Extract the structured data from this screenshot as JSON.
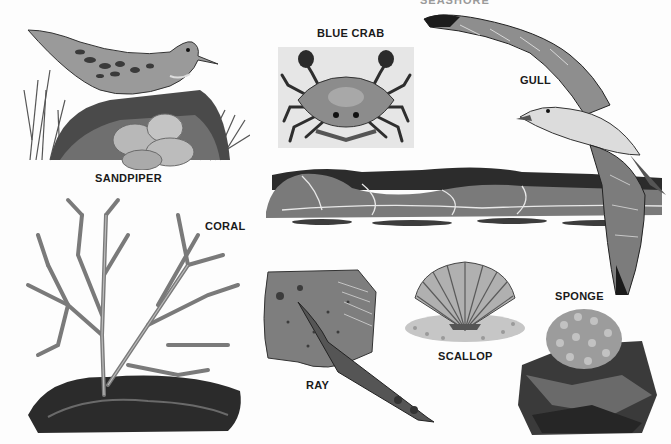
{
  "page": {
    "type": "illustration-plate",
    "header_fragment": "SEASHORE",
    "palette": {
      "background": "#fdfdfd",
      "ink_dark": "#1a1a1a",
      "ink_mid": "#6b6b6b",
      "ink_light": "#b5b5b5",
      "crab_panel": "#e6e6e6"
    }
  },
  "labels": {
    "sandpiper": "SANDPIPER",
    "blue_crab": "BLUE CRAB",
    "gull": "GULL",
    "coral": "CORAL",
    "ray": "RAY",
    "scallop": "SCALLOP",
    "sponge": "SPONGE"
  },
  "illustrations": [
    {
      "id": "sandpiper",
      "caption": "SANDPIPER",
      "subject": "sandpiper bird on nest with four speckled eggs in grass"
    },
    {
      "id": "blue_crab",
      "caption": "BLUE CRAB",
      "subject": "blue crab viewed from above on gray panel"
    },
    {
      "id": "gull",
      "caption": "GULL",
      "subject": "gull in flight with wings spread"
    },
    {
      "id": "wave",
      "caption": "",
      "subject": "breaking ocean wave"
    },
    {
      "id": "coral",
      "caption": "CORAL",
      "subject": "branching coral on dark rock"
    },
    {
      "id": "ray",
      "caption": "RAY",
      "subject": "ray with long tail"
    },
    {
      "id": "scallop",
      "caption": "SCALLOP",
      "subject": "scallop shell on gravel"
    },
    {
      "id": "sponge",
      "caption": "SPONGE",
      "subject": "sponge growing on rock"
    }
  ]
}
